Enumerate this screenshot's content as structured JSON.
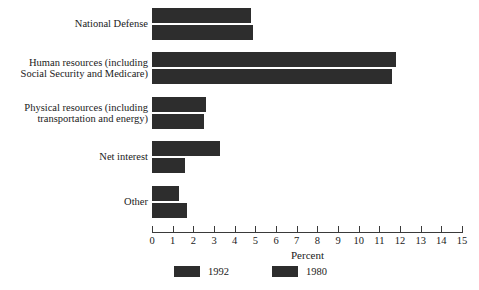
{
  "chart_data": {
    "type": "bar",
    "orientation": "horizontal",
    "title": "",
    "xlabel": "Percent",
    "ylabel": "",
    "xlim": [
      0,
      15
    ],
    "grid": false,
    "legend_position": "bottom",
    "categories": [
      "National Defense",
      "Human resources (including\nSocial Security and Medicare)",
      "Physical resources (including\ntransportation and energy)",
      "Net interest",
      "Other"
    ],
    "series": [
      {
        "name": "1992",
        "color": "#2d2d2d",
        "values": [
          4.8,
          11.8,
          2.6,
          3.3,
          1.3
        ]
      },
      {
        "name": "1980",
        "color": "#2d2d2d",
        "values": [
          4.9,
          11.6,
          2.5,
          1.6,
          1.7
        ]
      }
    ],
    "xticks": [
      {
        "value": 0,
        "label": "0"
      },
      {
        "value": 1,
        "label": "1"
      },
      {
        "value": 2,
        "label": "2"
      },
      {
        "value": 3,
        "label": "3"
      },
      {
        "value": 4,
        "label": "4"
      },
      {
        "value": 5,
        "label": "5"
      },
      {
        "value": 6,
        "label": "6"
      },
      {
        "value": 7,
        "label": "7"
      },
      {
        "value": 8,
        "label": "8"
      },
      {
        "value": 9,
        "label": "9"
      },
      {
        "value": 10,
        "label": "10"
      },
      {
        "value": 11,
        "label": "11"
      },
      {
        "value": 12,
        "label": "12"
      },
      {
        "value": 13,
        "label": "13"
      },
      {
        "value": 14,
        "label": "14"
      },
      {
        "value": 15,
        "label": "15"
      }
    ],
    "legend": [
      {
        "label": "1992",
        "color": "#2d2d2d"
      },
      {
        "label": "1980",
        "color": "#2d2d2d"
      }
    ]
  }
}
